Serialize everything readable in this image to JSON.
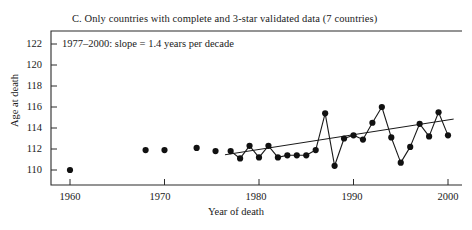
{
  "chart_data": {
    "type": "scatter",
    "title": "C. Only countries with complete and 3-star validated data (7 countries)",
    "xlabel": "Year of death",
    "ylabel": "Age at death",
    "xlim": [
      1958,
      2001
    ],
    "ylim": [
      109.2,
      122.8
    ],
    "grid": false,
    "legend": null,
    "annotations": [
      {
        "text": "1977–2000: slope = 1.4 years per decade",
        "x": 1960.5,
        "y": 121.6
      }
    ],
    "xticks": [
      1960,
      1970,
      1980,
      1990,
      2000
    ],
    "xtick_labels": [
      "1960",
      "1970",
      "1980",
      "1990",
      "2000"
    ],
    "yticks": [
      110,
      112,
      114,
      116,
      118,
      120,
      122
    ],
    "ytick_labels": [
      "110",
      "112",
      "114",
      "116",
      "118",
      "120",
      "122"
    ],
    "series": [
      {
        "name": "Isolated early maxima (unconnected points)",
        "marker": "filled-circle",
        "connected": false,
        "x": [
          1960.0,
          1968.0,
          1970.0,
          1973.4,
          1975.4
        ],
        "y": [
          110.0,
          111.9,
          111.9,
          112.1,
          111.8
        ]
      },
      {
        "name": "Maximum reported age at death, 1977–2000 (connected)",
        "marker": "filled-circle",
        "connected": true,
        "x": [
          1977,
          1978,
          1979,
          1980,
          1981,
          1982,
          1983,
          1984,
          1985,
          1986,
          1987,
          1988,
          1989,
          1990,
          1991,
          1992,
          1993,
          1994,
          1995,
          1996,
          1997,
          1998,
          1999,
          2000
        ],
        "y": [
          111.8,
          111.1,
          112.3,
          111.2,
          112.3,
          111.2,
          111.4,
          111.4,
          111.4,
          111.9,
          115.4,
          110.4,
          113.0,
          113.3,
          112.9,
          114.5,
          116.0,
          113.1,
          110.7,
          112.2,
          114.4,
          113.2,
          115.5,
          113.3
        ]
      }
    ],
    "trendline": {
      "name": "Least-squares fit 1977–2000",
      "x": [
        1976.4,
        2000.6
      ],
      "y": [
        111.45,
        114.85
      ],
      "slope_per_decade": 1.4
    }
  },
  "axes": {
    "x_axis_name": "year-of-death-axis",
    "y_axis_name": "age-at-death-axis"
  }
}
